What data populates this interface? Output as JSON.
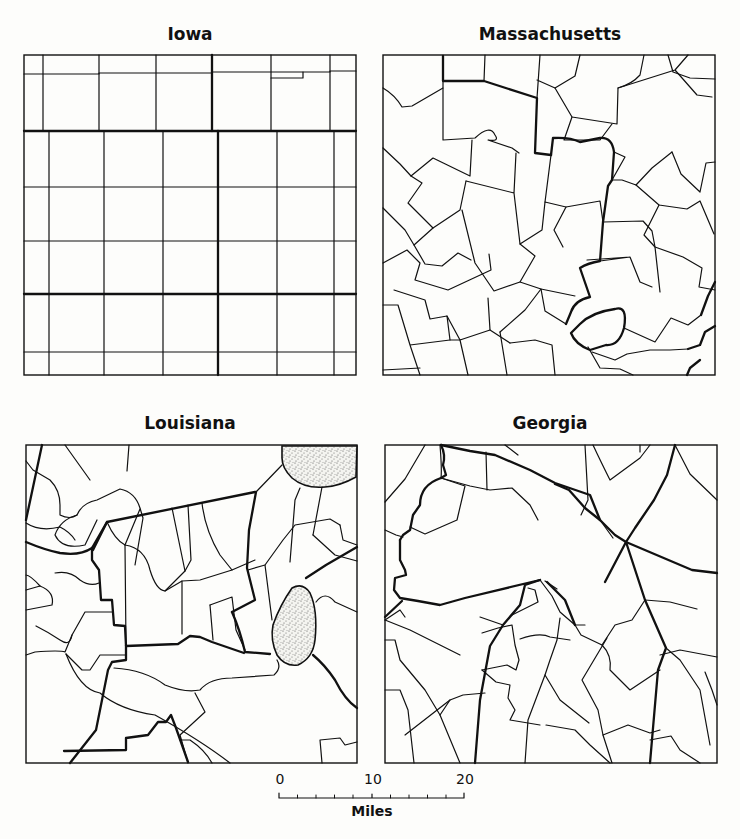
{
  "figure": {
    "panels": [
      {
        "id": "iowa",
        "title": "Iowa",
        "pattern": "rectilinear grid"
      },
      {
        "id": "massachusetts",
        "title": "Massachusetts",
        "pattern": "irregular polygons"
      },
      {
        "id": "louisiana",
        "title": "Louisiana",
        "pattern": "irregular with stippled areas",
        "stippled_areas": 2
      },
      {
        "id": "georgia",
        "title": "Georgia",
        "pattern": "irregular polygons"
      }
    ],
    "scale_bar": {
      "ticks": [
        "0",
        "10",
        "20"
      ],
      "unit": "Miles",
      "minor_divisions": 10
    },
    "colors": {
      "ink": "#111111",
      "paper": "#fdfdfb",
      "stipple": "#555555"
    }
  }
}
